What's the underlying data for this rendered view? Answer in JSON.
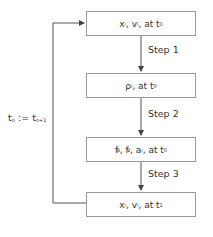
{
  "diagram": {
    "nodes": [
      {
        "id": "box1",
        "var1": "x",
        "var1_sub": "i",
        "var2": "v",
        "var2_sub": "i",
        "at": "at t",
        "t_sub": "0"
      },
      {
        "id": "box2",
        "var1": "ρ",
        "var1_sub": "i",
        "at": "at t",
        "t_sub": "0"
      },
      {
        "id": "box3",
        "f1": "f",
        "f1_sub": "i",
        "f1_sup": "p",
        "f2": "f",
        "f2_sub": "i",
        "f2_sup": "v",
        "a": "a",
        "a_sub": "i",
        "at": "at t",
        "t_sub": "0"
      },
      {
        "id": "box4",
        "var1": "x",
        "var1_sub": "i",
        "var2": "v",
        "var2_sub": "i",
        "at": "at t",
        "t_sub": "1"
      }
    ],
    "steps": [
      "Step 1",
      "Step 2",
      "Step 3"
    ],
    "loop_label": {
      "lhs": "t",
      "lhs_sub": "n",
      "op": ":=",
      "rhs": "t",
      "rhs_sub": "n+1"
    },
    "colors": {
      "line": "#555555",
      "border": "#9a9a9a",
      "text": "#333333"
    }
  }
}
